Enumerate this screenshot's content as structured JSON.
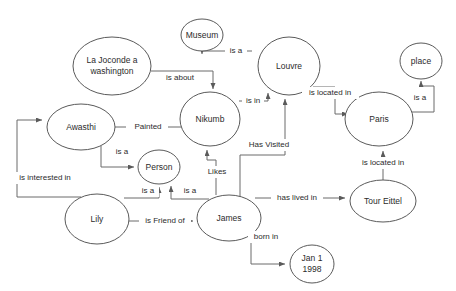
{
  "diagram": {
    "type": "knowledge-graph",
    "background_color": "#ffffff",
    "node_stroke_color": "#5a5a5a",
    "edge_stroke_color": "#6b6b6b",
    "text_color": "#2b2b2b"
  },
  "nodes": [
    {
      "id": "la-joconde",
      "label": "La Joconde a washington",
      "lines": [
        "La Joconde a",
        "washington"
      ],
      "cx": 112,
      "cy": 66,
      "rx": 39,
      "ry": 29,
      "font_size": 8.5
    },
    {
      "id": "museum",
      "label": "Museum",
      "lines": [
        "Museum"
      ],
      "cx": 202,
      "cy": 35,
      "rx": 21,
      "ry": 16,
      "font_size": 8.5
    },
    {
      "id": "louvre",
      "label": "Louvre",
      "lines": [
        "Louvre"
      ],
      "cx": 289,
      "cy": 66,
      "rx": 31,
      "ry": 29,
      "font_size": 8.5
    },
    {
      "id": "place",
      "label": "place",
      "lines": [
        "place"
      ],
      "cx": 421,
      "cy": 61,
      "rx": 21,
      "ry": 18,
      "font_size": 8.5
    },
    {
      "id": "nikumb",
      "label": "Nikumb",
      "lines": [
        "Nikumb"
      ],
      "cx": 210,
      "cy": 119,
      "rx": 30,
      "ry": 27,
      "font_size": 8.5
    },
    {
      "id": "paris",
      "label": "Paris",
      "lines": [
        "Paris"
      ],
      "cx": 379,
      "cy": 119,
      "rx": 34,
      "ry": 27,
      "font_size": 8.5
    },
    {
      "id": "awasthi",
      "label": "Awasthi",
      "lines": [
        "Awasthi"
      ],
      "cx": 81,
      "cy": 127,
      "rx": 34,
      "ry": 23,
      "font_size": 8.5
    },
    {
      "id": "person",
      "label": "Person",
      "lines": [
        "Person"
      ],
      "cx": 159,
      "cy": 167,
      "rx": 21,
      "ry": 17,
      "font_size": 8.5
    },
    {
      "id": "tour-eittel",
      "label": "Tour Eittel",
      "lines": [
        "Tour Eittel"
      ],
      "cx": 383,
      "cy": 201,
      "rx": 33,
      "ry": 21,
      "font_size": 8.5
    },
    {
      "id": "lily",
      "label": "Lily",
      "lines": [
        "Lily"
      ],
      "cx": 97,
      "cy": 219,
      "rx": 32,
      "ry": 25,
      "font_size": 8.5
    },
    {
      "id": "james",
      "label": "James",
      "lines": [
        "James"
      ],
      "cx": 229,
      "cy": 218,
      "rx": 32,
      "ry": 23,
      "font_size": 8.5
    },
    {
      "id": "jan-1-1998",
      "label": "Jan 1 1998",
      "lines": [
        "Jan 1",
        "1998"
      ],
      "cx": 312,
      "cy": 264,
      "rx": 22,
      "ry": 19,
      "font_size": 8.5
    }
  ],
  "edges": [
    {
      "id": "e1",
      "from": "la-joconde",
      "to": "nikumb",
      "label": "is about",
      "label_x": 180,
      "label_y": 78,
      "font_size": 8
    },
    {
      "id": "e2",
      "from": "nikumb",
      "to": "museum",
      "label": "is a",
      "label_x": 236,
      "label_y": 51,
      "font_size": 8
    },
    {
      "id": "e3",
      "from": "nikumb",
      "to": "louvre",
      "label": "is in",
      "label_x": 253,
      "label_y": 101,
      "font_size": 8
    },
    {
      "id": "e4",
      "from": "louvre",
      "to": "paris",
      "label": "is located in",
      "label_x": 330,
      "label_y": 93,
      "font_size": 8
    },
    {
      "id": "e5",
      "from": "paris",
      "to": "place",
      "label": "is a",
      "label_x": 420,
      "label_y": 98,
      "font_size": 8
    },
    {
      "id": "e6",
      "from": "awasthi",
      "to": "nikumb",
      "label": "Painted",
      "label_x": 148,
      "label_y": 127,
      "font_size": 8
    },
    {
      "id": "e7",
      "from": "awasthi",
      "to": "person",
      "label": "is a",
      "label_x": 122,
      "label_y": 152,
      "font_size": 8
    },
    {
      "id": "e8",
      "from": "lily",
      "to": "awasthi",
      "label": "is interested in",
      "label_x": 45,
      "label_y": 178,
      "font_size": 8
    },
    {
      "id": "e9",
      "from": "lily",
      "to": "person",
      "label": "is a",
      "label_x": 148,
      "label_y": 191,
      "font_size": 8
    },
    {
      "id": "e10",
      "from": "james",
      "to": "person",
      "label": "is a",
      "label_x": 190,
      "label_y": 191,
      "font_size": 8
    },
    {
      "id": "e11",
      "from": "lily",
      "to": "james",
      "label": "is Friend of",
      "label_x": 165,
      "label_y": 221,
      "font_size": 8
    },
    {
      "id": "e12",
      "from": "james",
      "to": "nikumb",
      "label": "Likes",
      "label_x": 216,
      "label_y": 172,
      "font_size": 8
    },
    {
      "id": "e13",
      "from": "james",
      "to": "louvre",
      "label": "Has Visited",
      "label_x": 268,
      "label_y": 145,
      "font_size": 8
    },
    {
      "id": "e14",
      "from": "james",
      "to": "tour-eittel",
      "label": "has lived in",
      "label_x": 296,
      "label_y": 198,
      "font_size": 8
    },
    {
      "id": "e15",
      "from": "tour-eittel",
      "to": "paris",
      "label": "is located in",
      "label_x": 383,
      "label_y": 163,
      "font_size": 8
    },
    {
      "id": "e16",
      "from": "james",
      "to": "jan-1-1998",
      "label": "born in",
      "label_x": 263,
      "label_y": 237,
      "font_size": 8
    }
  ]
}
